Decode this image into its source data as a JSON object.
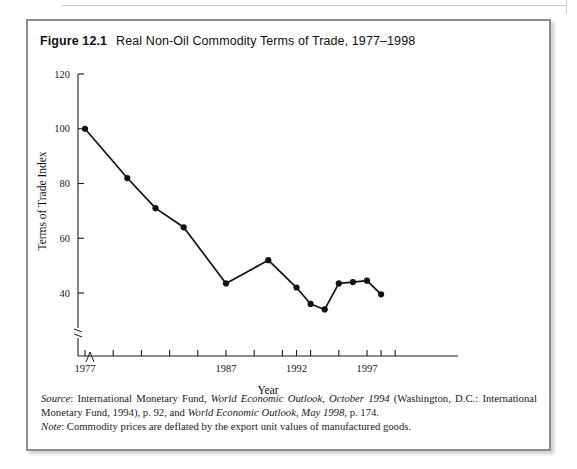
{
  "figure": {
    "number": "Figure 12.1",
    "title": "Real Non-Oil Commodity Terms of Trade, 1977–1998"
  },
  "notes": {
    "source_lead": "Source",
    "source_p1": ": International Monetary Fund, ",
    "source_i1": "World Economic Outlook, October 1994",
    "source_p2": " (Washington, D.C.: International Monetary Fund, 1994), p. 92, and ",
    "source_i2": "World Economic Outlook, May 1998",
    "source_p3": ", p. 174.",
    "note_lead": "Note",
    "note_text": ": Commodity prices are deflated by the export unit values of manufactured goods."
  },
  "chart_data": {
    "type": "line",
    "title": "Real Non-Oil Commodity Terms of Trade, 1977–1998",
    "xlabel": "Year",
    "ylabel": "Terms of Trade Index",
    "xlim": [
      1977,
      1998
    ],
    "ylim": [
      30,
      120
    ],
    "y_axis_break": true,
    "x_axis_break": true,
    "grid": false,
    "legend": "none",
    "ytick_labels": [
      "120",
      "100",
      "80",
      "60",
      "40"
    ],
    "ytick_values": [
      120,
      100,
      80,
      60,
      40
    ],
    "xtick_values": [
      1977,
      1979,
      1981,
      1983,
      1985,
      1987,
      1989,
      1991,
      1992,
      1993,
      1995,
      1997
    ],
    "xtick_labels_shown": [
      "1977",
      "1987",
      "1992",
      "1997"
    ],
    "xtick_label_values": [
      1977,
      1987,
      1992,
      1997
    ],
    "series": [
      {
        "name": "Real Non-Oil Commodity Terms of Trade",
        "x": [
          1977,
          1980,
          1982,
          1984,
          1987,
          1990,
          1992,
          1993,
          1994,
          1995,
          1996,
          1997,
          1998
        ],
        "y": [
          100,
          82,
          71,
          64,
          43.5,
          52,
          42,
          36,
          34,
          43.5,
          44,
          44.5,
          39.5
        ]
      }
    ]
  }
}
